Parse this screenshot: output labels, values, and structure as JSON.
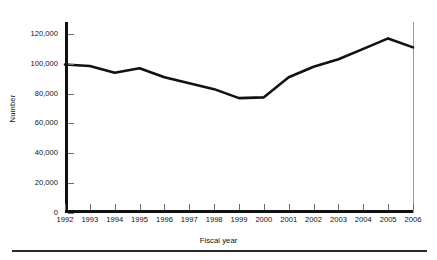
{
  "chart_data": {
    "type": "line",
    "title": "",
    "xlabel": "Fiscal year",
    "ylabel": "Number",
    "x": [
      1992,
      1993,
      1994,
      1995,
      1996,
      1997,
      1998,
      1999,
      2000,
      2001,
      2002,
      2003,
      2004,
      2005,
      2006
    ],
    "categories": [
      "1992",
      "1993",
      "1994",
      "1995",
      "1996",
      "1997",
      "1998",
      "1999",
      "2000",
      "2001",
      "2002",
      "2003",
      "2004",
      "2005",
      "2006"
    ],
    "values": [
      99500,
      98500,
      94000,
      97000,
      91000,
      87000,
      83000,
      77000,
      77500,
      91000,
      98000,
      103000,
      110000,
      117000,
      111000
    ],
    "series": [
      {
        "name": "Number",
        "values": [
          99500,
          98500,
          94000,
          97000,
          91000,
          87000,
          83000,
          77000,
          77500,
          91000,
          98000,
          103000,
          110000,
          117000,
          111000
        ]
      }
    ],
    "ylim": [
      0,
      128000
    ],
    "xlim": [
      1992,
      2006
    ],
    "yticks": [
      0,
      20000,
      40000,
      60000,
      80000,
      100000,
      120000
    ],
    "ytick_labels": [
      "0",
      "20,000",
      "40,000",
      "60,000",
      "80,000",
      "100,000",
      "120,000"
    ],
    "grid": false,
    "legend": false,
    "line_color": "#111111"
  }
}
